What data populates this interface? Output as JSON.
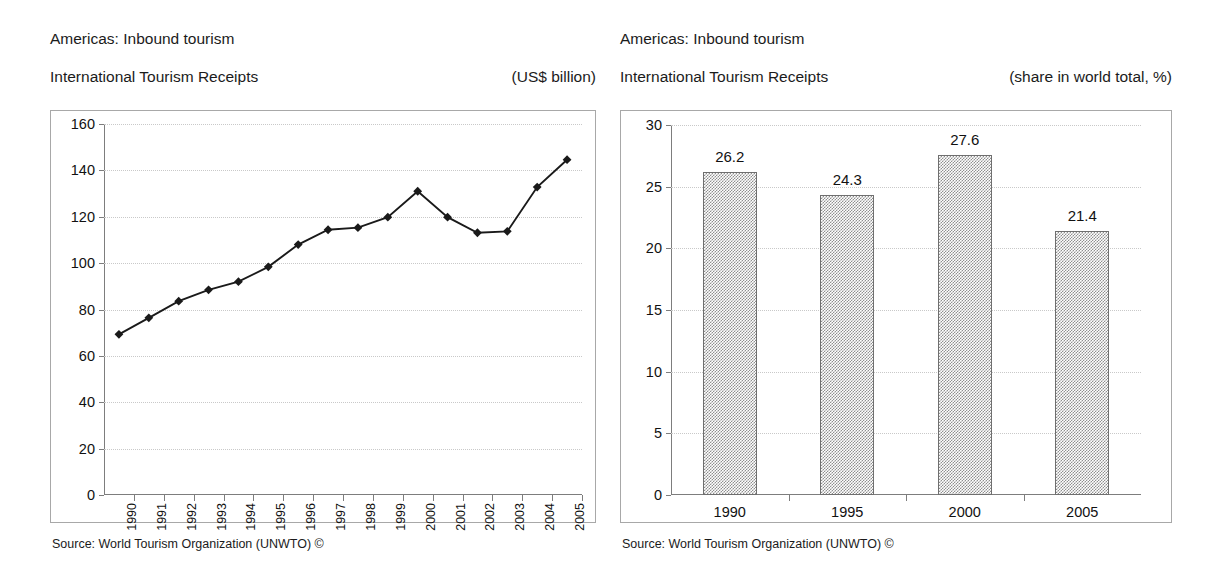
{
  "left_panel": {
    "title_line1": "Americas: Inbound tourism",
    "title_line2": "International Tourism Receipts",
    "unit": "(US$ billion)",
    "source": "Source: World Tourism Organization (UNWTO) ©"
  },
  "right_panel": {
    "title_line1": "Americas: Inbound tourism",
    "title_line2": "International Tourism Receipts",
    "unit": "(share in world total, %)",
    "source": "Source: World Tourism Organization (UNWTO) ©"
  },
  "chart_data": [
    {
      "type": "line",
      "title": "Americas: Inbound tourism — International Tourism Receipts",
      "subtitle": "(US$ billion)",
      "xlabel": "",
      "ylabel": "",
      "ylim": [
        0,
        160
      ],
      "yticks": [
        0,
        20,
        40,
        60,
        80,
        100,
        120,
        140,
        160
      ],
      "ytick_labels": [
        "0",
        "20",
        "40",
        "60",
        "80",
        "100",
        "120",
        "140",
        "160"
      ],
      "grid": true,
      "legend": "none",
      "marker": "diamond",
      "categories": [
        "1990",
        "1991",
        "1992",
        "1993",
        "1994",
        "1995",
        "1996",
        "1997",
        "1998",
        "1999",
        "2000",
        "2001",
        "2002",
        "2003",
        "2004",
        "2005"
      ],
      "values": [
        69.3,
        76.4,
        83.6,
        88.5,
        92.0,
        98.4,
        108.0,
        114.4,
        115.3,
        119.8,
        131.0,
        119.8,
        113.1,
        113.7,
        132.8,
        144.6
      ]
    },
    {
      "type": "bar",
      "title": "Americas: Inbound tourism — International Tourism Receipts",
      "subtitle": "(share in world total, %)",
      "xlabel": "",
      "ylabel": "",
      "ylim": [
        0,
        30
      ],
      "yticks": [
        0,
        5,
        10,
        15,
        20,
        25,
        30
      ],
      "ytick_labels": [
        "0",
        "5",
        "10",
        "15",
        "20",
        "25",
        "30"
      ],
      "grid": true,
      "legend": "none",
      "categories": [
        "1990",
        "1995",
        "2000",
        "2005"
      ],
      "values": [
        26.2,
        24.3,
        27.6,
        21.4
      ],
      "data_labels": [
        "26.2",
        "24.3",
        "27.6",
        "21.4"
      ]
    }
  ],
  "colors": {
    "line": "#1a1a1a",
    "bar_fill": "#9a9a9a",
    "bar_border": "#6f6f6f",
    "grid": "#c9c9c9",
    "axis": "#7d7d7d",
    "box_border": "#a8a8a8",
    "text": "#1a1a1a"
  }
}
